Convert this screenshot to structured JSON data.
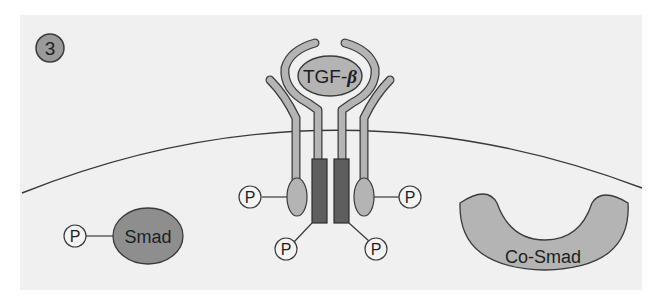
{
  "figure": {
    "step_number": "3",
    "ligand_label": "TGF-",
    "ligand_symbol": "β",
    "smad_label": "Smad",
    "cosmad_label": "Co-Smad",
    "phosphate_label": "P"
  },
  "colors": {
    "panel_bg": "#f0f0f0",
    "page_bg": "#ffffff",
    "light_gray": "#b4b4b4",
    "mid_gray": "#8e8e8e",
    "dark_gray": "#5e5e5e",
    "stroke": "#3a3a3a"
  }
}
